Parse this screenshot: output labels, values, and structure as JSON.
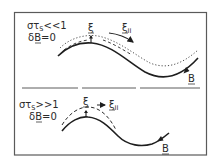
{
  "figure": {
    "panels": [
      {
        "id": "top",
        "condition": {
          "prefix": "στ",
          "subscript": "S",
          "relation": "<<1"
        },
        "perturbation": {
          "prefix": "δ",
          "vector": "B",
          "suffix": "=0"
        },
        "xi_label": "ξ",
        "xi_parallel_label": "ξ",
        "xi_parallel_subscript": "II",
        "field_label": "B",
        "curves": [
          "field line (solid)",
          "displaced line (dotted)",
          "displacement (dashed)"
        ]
      },
      {
        "id": "bottom",
        "condition": {
          "prefix": "στ",
          "subscript": "S",
          "relation": ">>1"
        },
        "perturbation": {
          "prefix": "δ",
          "vector": "B",
          "suffix": "=0"
        },
        "xi_label": "ξ",
        "xi_parallel_label": "ξ",
        "xi_parallel_subscript": "II",
        "field_label": "B",
        "curves": [
          "field line (solid)",
          "displaced line (dashed)"
        ]
      }
    ],
    "colors": {
      "ink": "#1e1e1e",
      "frame": "#5a5a5a",
      "background": "#ffffff"
    }
  }
}
